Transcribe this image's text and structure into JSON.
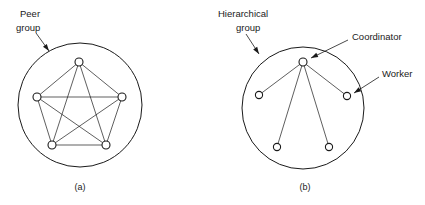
{
  "figure": {
    "background_color": "#ffffff",
    "stroke_color": "#1a1a1a",
    "node_fill_color": "#ffffff"
  },
  "panels": [
    {
      "id": "a",
      "caption": "(a)",
      "caption_pos": {
        "x": 80,
        "y": 188
      },
      "type": "peer-group",
      "group_circle": {
        "cx": 80,
        "cy": 105,
        "r": 62
      },
      "label": {
        "line1": "Peer",
        "line2": "group",
        "line1_pos": {
          "x": 20,
          "y": 14
        },
        "line2_pos": {
          "x": 16,
          "y": 28
        },
        "leader": {
          "x1": 36,
          "y1": 33,
          "x2": 49,
          "y2": 51
        }
      },
      "nodes": [
        {
          "name": "peer-node-top",
          "cx": 79,
          "cy": 62,
          "r": 4
        },
        {
          "name": "peer-node-right",
          "cx": 122,
          "cy": 97,
          "r": 4
        },
        {
          "name": "peer-node-bottom-right",
          "cx": 106,
          "cy": 145,
          "r": 4
        },
        {
          "name": "peer-node-bottom-left",
          "cx": 52,
          "cy": 145,
          "r": 4
        },
        {
          "name": "peer-node-left",
          "cx": 37,
          "cy": 97,
          "r": 4
        }
      ],
      "edges": [
        [
          0,
          1
        ],
        [
          1,
          2
        ],
        [
          2,
          3
        ],
        [
          3,
          4
        ],
        [
          4,
          0
        ],
        [
          0,
          2
        ],
        [
          0,
          3
        ],
        [
          1,
          3
        ],
        [
          1,
          4
        ],
        [
          2,
          4
        ]
      ]
    },
    {
      "id": "b",
      "caption": "(b)",
      "caption_pos": {
        "x": 305,
        "y": 188
      },
      "type": "hierarchical-group",
      "group_circle": {
        "cx": 303,
        "cy": 108,
        "r": 61
      },
      "label": {
        "line1": "Hierarchical",
        "line2": "group",
        "line1_pos": {
          "x": 218,
          "y": 14
        },
        "line2_pos": {
          "x": 236,
          "y": 28
        },
        "leader": {
          "x1": 246,
          "y1": 34,
          "x2": 259,
          "y2": 54
        }
      },
      "coordinator_label": {
        "text": "Coordinator",
        "pos": {
          "x": 352,
          "y": 37
        },
        "leader": {
          "x1": 348,
          "y1": 40,
          "x2": 311,
          "y2": 58
        }
      },
      "worker_label": {
        "text": "Worker",
        "pos": {
          "x": 382,
          "y": 74
        },
        "leader": {
          "x1": 379,
          "y1": 77,
          "x2": 354,
          "y2": 93
        }
      },
      "nodes": [
        {
          "name": "coordinator-node",
          "cx": 303,
          "cy": 62,
          "r": 4,
          "role": "coordinator"
        },
        {
          "name": "worker-node-left",
          "cx": 259,
          "cy": 95,
          "r": 3.6,
          "role": "worker"
        },
        {
          "name": "worker-node-right",
          "cx": 347,
          "cy": 96,
          "r": 3.6,
          "role": "worker"
        },
        {
          "name": "worker-node-bottom-left",
          "cx": 277,
          "cy": 147,
          "r": 3.6,
          "role": "worker"
        },
        {
          "name": "worker-node-bottom-right",
          "cx": 329,
          "cy": 147,
          "r": 3.6,
          "role": "worker"
        }
      ],
      "edges": [
        [
          0,
          1
        ],
        [
          0,
          2
        ],
        [
          0,
          3
        ],
        [
          0,
          4
        ]
      ]
    }
  ]
}
